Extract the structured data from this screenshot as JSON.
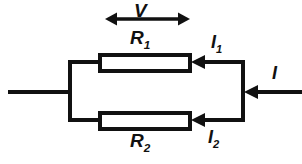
{
  "figure": {
    "kind": "parallel-resistor-circuit-diagram",
    "width": 302,
    "height": 164,
    "background_color": "#FFFFFF",
    "stroke_color": "#111111"
  },
  "labels": {
    "voltage": {
      "symbol": "V",
      "subscript": ""
    },
    "resistor_top": {
      "symbol": "R",
      "subscript": "1"
    },
    "resistor_bottom": {
      "symbol": "R",
      "subscript": "2"
    },
    "current_top": {
      "symbol": "I",
      "subscript": "1"
    },
    "current_bottom": {
      "symbol": "I",
      "subscript": "2"
    },
    "current_total": {
      "symbol": "I",
      "subscript": ""
    }
  },
  "geometry": {
    "left_lead": {
      "x1": 8,
      "y1": 92,
      "x2": 70,
      "y2": 92
    },
    "left_bus": {
      "x": 70,
      "y1": 62,
      "y2": 121
    },
    "right_bus": {
      "x": 243,
      "y1": 62,
      "y2": 121
    },
    "right_lead": {
      "x1": 244,
      "y1": 92,
      "x2": 302,
      "y2": 92
    },
    "resistor_top_box": {
      "x": 100,
      "y": 55,
      "width": 90,
      "height": 15
    },
    "resistor_bottom_box": {
      "x": 100,
      "y": 113,
      "width": 90,
      "height": 15
    },
    "top_branch_wire": {
      "x1": 191,
      "y1": 62,
      "x2": 243,
      "y2": 62
    },
    "bottom_branch_wire": {
      "x1": 191,
      "y1": 120,
      "x2": 243,
      "y2": 120
    },
    "top_lead_left": {
      "x1": 70,
      "y1": 62,
      "x2": 100,
      "y2": 62
    },
    "bottom_lead_left": {
      "x1": 70,
      "y1": 120,
      "x2": 100,
      "y2": 120
    },
    "voltage_arrow": {
      "x1": 105,
      "y1": 19,
      "x2": 190,
      "y2": 19,
      "double_headed": true
    }
  }
}
